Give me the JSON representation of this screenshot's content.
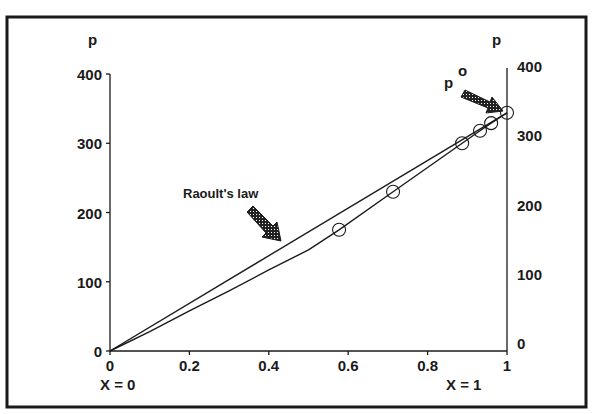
{
  "chart_data": {
    "type": "line",
    "title": "",
    "xlabel_left": "X = 0",
    "xlabel_right": "X = 1",
    "ylabel_left": "p",
    "ylabel_right": "p",
    "xlim": [
      0,
      1
    ],
    "ylim": [
      0,
      400
    ],
    "xticks": [
      0,
      0.2,
      0.4,
      0.6,
      0.8,
      1
    ],
    "xtick_labels": [
      "0",
      "0.2",
      "0.4",
      "0.6",
      "0.8",
      "1"
    ],
    "yticks": [
      0,
      100,
      200,
      300,
      400
    ],
    "ytick_labels": [
      "0",
      "100",
      "200",
      "300",
      "400"
    ],
    "grid": false,
    "legend": "none",
    "series": [
      {
        "name": "Raoult's law",
        "style": "line",
        "x": [
          0,
          1
        ],
        "y": [
          0,
          344
        ]
      },
      {
        "name": "Measured vapour pressure (curve)",
        "style": "line",
        "x": [
          0,
          0.1,
          0.2,
          0.3,
          0.4,
          0.5,
          0.577,
          0.713,
          0.8,
          0.887,
          0.932,
          0.96,
          1.0
        ],
        "y": [
          0,
          28,
          58,
          87,
          117,
          146,
          175,
          230,
          265,
          300,
          318,
          329,
          344
        ]
      },
      {
        "name": "Measured points",
        "style": "open-circle",
        "x": [
          0.577,
          0.713,
          0.887,
          0.932,
          0.96,
          1.0
        ],
        "y": [
          175,
          230,
          300,
          318,
          329,
          344
        ]
      }
    ],
    "annotations": [
      {
        "text": "Raoult's law",
        "points_to": "Raoult's law line near x=0.43"
      },
      {
        "text": "p",
        "superscript": "o",
        "points_to": "point at x=1, p≈344"
      }
    ]
  },
  "labels": {
    "raoult": "Raoult's law",
    "p0_main": "p",
    "p0_sup": "o"
  }
}
